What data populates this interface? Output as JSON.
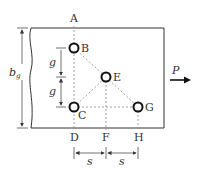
{
  "diagram": {
    "points": {
      "A": {
        "label": "A"
      },
      "B": {
        "label": "B"
      },
      "C": {
        "label": "C"
      },
      "D": {
        "label": "D"
      },
      "E": {
        "label": "E"
      },
      "F": {
        "label": "F"
      },
      "G": {
        "label": "G"
      },
      "H": {
        "label": "H"
      }
    },
    "dimensions": {
      "gauge_upper": "g",
      "gauge_lower": "g",
      "spacing_left": "s",
      "spacing_right": "s",
      "gross_width": "b",
      "gross_width_sub": "g"
    },
    "load": {
      "label": "P",
      "direction": "right"
    },
    "colors": {
      "line": "#333333",
      "dashed": "#888888",
      "background": "#ffffff"
    }
  }
}
